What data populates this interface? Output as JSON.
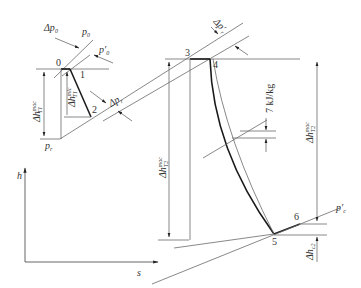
{
  "diagram": {
    "type": "h-s diagram (turbine expansion process)",
    "axes": {
      "y_label": "h",
      "x_label": "s"
    },
    "points": [
      {
        "id": "0",
        "label": "0"
      },
      {
        "id": "1",
        "label": "1"
      },
      {
        "id": "2",
        "label": "2"
      },
      {
        "id": "3",
        "label": "3"
      },
      {
        "id": "4",
        "label": "4"
      },
      {
        "id": "5",
        "label": "5"
      },
      {
        "id": "6",
        "label": "6"
      }
    ],
    "isobars": {
      "p0": "p",
      "p0_sub": "0",
      "p0_prime": "p′",
      "p0_prime_sub": "0",
      "pr": "p",
      "pr_sub": "r",
      "pc_prime": "p′",
      "pc_prime_sub": "c"
    },
    "pressure_drops": {
      "dp0": "Δp",
      "dp0_sub": "0",
      "dpr": "Δp",
      "dpr_sub": "r",
      "dpr_prime": "Δp′",
      "dpr_prime_sub": "r"
    },
    "enthalpy_drops": {
      "dh_t1_mac": "Δh",
      "dh_t1_mac_sup": "mac",
      "dh_t1_mac_sub": "T1",
      "dh_t1_mic": "Δh",
      "dh_t1_mic_sup": "mic",
      "dh_t1_mic_sub": "T1",
      "dh_t2_mac_left": "Δh",
      "dh_t2_mac_left_sup": "mac",
      "dh_t2_mac_left_sub": "T2",
      "dh_t2_mac_right": "Δh",
      "dh_t2_mac_right_sup": "mac",
      "dh_t2_mac_right_sub": "T2",
      "dh_c2": "Δh",
      "dh_c2_sub": "c2"
    },
    "annotation": "7 kJ/kg"
  }
}
